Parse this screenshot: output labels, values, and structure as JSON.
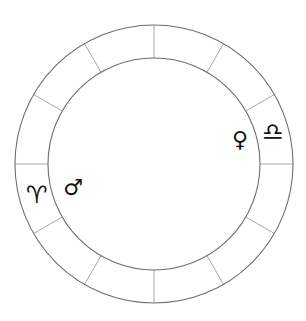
{
  "chart": {
    "title": "",
    "type": "zodiac-wheel",
    "center": {
      "x": 154,
      "y": 164
    },
    "outer_radius": 139,
    "inner_radius": 106,
    "segments": 12,
    "segment_angles_deg": [
      0,
      30,
      60,
      90,
      120,
      150,
      180,
      210,
      240,
      270,
      300,
      330
    ],
    "colors": {
      "ring_stroke": "#6e6e6e",
      "divider_stroke": "#a8a8a8",
      "glyph": "#111111",
      "background": "#ffffff"
    }
  },
  "signs": [
    {
      "name": "aries",
      "symbol": "♈︎",
      "x": 37,
      "y": 195
    },
    {
      "name": "libra",
      "symbol": "♎︎",
      "x": 273,
      "y": 132
    }
  ],
  "planets": [
    {
      "name": "mars",
      "symbol": "♂",
      "x": 73,
      "y": 188
    },
    {
      "name": "venus",
      "symbol": "♀",
      "x": 240,
      "y": 140
    }
  ]
}
